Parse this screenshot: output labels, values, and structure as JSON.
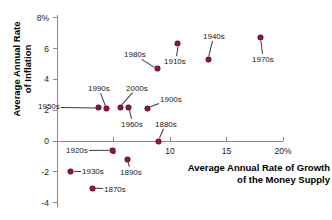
{
  "chart_data": {
    "type": "scatter",
    "title": "",
    "xlabel": "Average Annual Rate of Growth\nof the Money Supply",
    "ylabel": "Average Annual Rate\nof Inflation",
    "xlim": [
      -0.6,
      20.5
    ],
    "ylim": [
      -4.4,
      8.4
    ],
    "xticks": [
      5,
      10,
      15,
      20
    ],
    "xticklabels": [
      "5",
      "10",
      "15",
      "20%"
    ],
    "yticks": [
      -4,
      -2,
      0,
      2,
      4,
      6,
      8
    ],
    "yticklabels": [
      "-4",
      "-2",
      "0",
      "2",
      "4",
      "6",
      "8%"
    ],
    "grid": false,
    "legend": null,
    "marker_color": "#8B1838",
    "axis_color": "#8a8a8a",
    "points": [
      {
        "label": "1870s",
        "x": 3.1,
        "y": -3.1
      },
      {
        "label": "1880s",
        "x": 9.0,
        "y": 0.0
      },
      {
        "label": "1890s",
        "x": 6.2,
        "y": -1.2
      },
      {
        "label": "1900s",
        "x": 8.0,
        "y": 2.1
      },
      {
        "label": "1910s",
        "x": 10.7,
        "y": 6.3
      },
      {
        "label": "1920s",
        "x": 4.9,
        "y": -0.6
      },
      {
        "label": "1930s",
        "x": 1.2,
        "y": -2.0
      },
      {
        "label": "1940s",
        "x": 13.4,
        "y": 5.3
      },
      {
        "label": "1950s",
        "x": 3.7,
        "y": 2.2
      },
      {
        "label": "1960s",
        "x": 6.3,
        "y": 2.2
      },
      {
        "label": "1970s",
        "x": 18.0,
        "y": 6.7
      },
      {
        "label": "1980s",
        "x": 8.9,
        "y": 4.7
      },
      {
        "label": "1990s",
        "x": 4.4,
        "y": 2.1
      },
      {
        "label": "2000s",
        "x": 5.6,
        "y": 2.2
      }
    ]
  },
  "annotations": {
    "labels": [
      {
        "text": "1980s",
        "left": 124,
        "top": 50
      },
      {
        "text": "1910s",
        "left": 164,
        "top": 57
      },
      {
        "text": "1940s",
        "left": 203,
        "top": 32
      },
      {
        "text": "1970s",
        "left": 252,
        "top": 55
      },
      {
        "text": "1990s",
        "left": 88,
        "top": 84
      },
      {
        "text": "2000s",
        "left": 126,
        "top": 84
      },
      {
        "text": "1900s",
        "left": 160,
        "top": 95
      },
      {
        "text": "1950s",
        "left": 38,
        "top": 102
      },
      {
        "text": "1960s",
        "left": 121,
        "top": 120
      },
      {
        "text": "1880s",
        "left": 155,
        "top": 120
      },
      {
        "text": "1920s",
        "left": 66,
        "top": 146
      },
      {
        "text": "1930s",
        "left": 82,
        "top": 167
      },
      {
        "text": "1890s",
        "left": 120,
        "top": 168
      },
      {
        "text": "1870s",
        "left": 104,
        "top": 185
      }
    ]
  }
}
